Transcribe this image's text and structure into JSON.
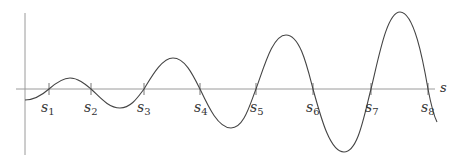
{
  "diagram": {
    "axis_label_x": "s",
    "colors": {
      "axis": "#9a9a9a",
      "curve": "#444444",
      "text": "#333333"
    },
    "zero_crossings": [
      {
        "name": "s",
        "sub": "1",
        "x": 49
      },
      {
        "name": "s",
        "sub": "2",
        "x": 91
      },
      {
        "name": "s",
        "sub": "3",
        "x": 144
      },
      {
        "name": "s",
        "sub": "4",
        "x": 200
      },
      {
        "name": "s",
        "sub": "5",
        "x": 256
      },
      {
        "name": "s",
        "sub": "6",
        "x": 313
      },
      {
        "name": "s",
        "sub": "7",
        "x": 371
      },
      {
        "name": "s",
        "sub": "8",
        "x": 428
      }
    ]
  }
}
